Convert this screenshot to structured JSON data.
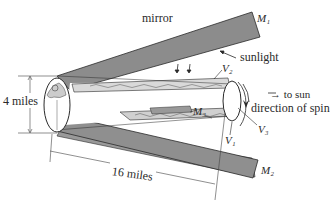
{
  "diagram": {
    "labels": {
      "mirror": "mirror",
      "m1": "M₁",
      "m2": "M₂",
      "m3": "M₃",
      "sunlight": "sunlight",
      "v1": "V₁",
      "v2": "V₂",
      "v3": "V₃",
      "to_sun": "→ to sun",
      "direction_of_spin": "direction of spin",
      "diameter": "4 miles",
      "length": "16 miles"
    },
    "colors": {
      "mirror_fill": "#8c8c8c",
      "outline": "#2a2a2a",
      "background": "#ffffff"
    }
  }
}
